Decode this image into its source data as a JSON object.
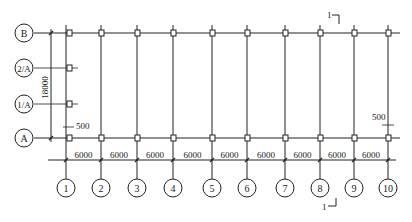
{
  "drawing": {
    "row_axes": [
      {
        "label": "B",
        "y": 33
      },
      {
        "label": "2/A",
        "y": 68
      },
      {
        "label": "1/A",
        "y": 104
      },
      {
        "label": "A",
        "y": 138
      }
    ],
    "column_axes": [
      {
        "label": "1",
        "x": 66
      },
      {
        "label": "2",
        "x": 101
      },
      {
        "label": "3",
        "x": 137
      },
      {
        "label": "4",
        "x": 173
      },
      {
        "label": "5",
        "x": 212
      },
      {
        "label": "6",
        "x": 247
      },
      {
        "label": "7",
        "x": 285
      },
      {
        "label": "8",
        "x": 320
      },
      {
        "label": "9",
        "x": 354
      },
      {
        "label": "10",
        "x": 388
      }
    ],
    "bay_dimensions": [
      "6000",
      "6000",
      "6000",
      "6000",
      "6000",
      "6000",
      "6000",
      "6000",
      "6000"
    ],
    "vertical_dimension": "18000",
    "offset_left": "500",
    "offset_right": "500",
    "section_mark_top": "1",
    "section_mark_bottom": "1"
  }
}
